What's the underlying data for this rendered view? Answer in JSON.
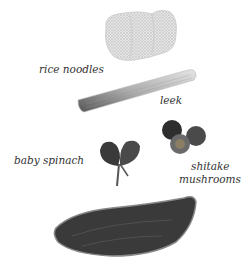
{
  "labels": {
    "rice_noodles": "rice noodles",
    "leek": "leek",
    "baby_spinach": "baby spinach",
    "shitake_line1": "shitake",
    "shitake_line2": "mushrooms"
  }
}
